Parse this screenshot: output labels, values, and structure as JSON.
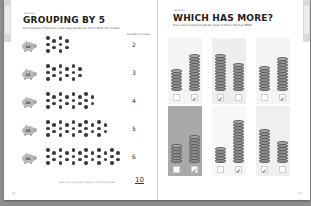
{
  "left_page": {
    "kicker": "Activity",
    "title": "GROUPING BY 5",
    "instruction": "Circle groups of 5 pennies. How many groups are there? Write the number.",
    "column_header": "Number of Groups",
    "rows": [
      {
        "pig_label": "10",
        "dot_count": 10,
        "dot_columns": 4,
        "answer": "2"
      },
      {
        "pig_label": "15",
        "dot_count": 15,
        "dot_columns": 6,
        "answer": "3"
      },
      {
        "pig_label": "20",
        "dot_count": 20,
        "dot_columns": 8,
        "answer": "4"
      },
      {
        "pig_label": "25",
        "dot_count": 25,
        "dot_columns": 10,
        "answer": "5"
      },
      {
        "pig_label": "30",
        "dot_count": 30,
        "dot_columns": 12,
        "answer": "6"
      }
    ],
    "footnote": "How many groups of 5 make 50? Write the number.",
    "total_answer": "10",
    "page_number": "10"
  },
  "right_page": {
    "kicker": "Activity",
    "title": "WHICH HAS MORE?",
    "instruction": "Put a check mark beneath the stack of dimes that has MORE.",
    "panels": [
      {
        "background": "#f4f4f4",
        "stacks": [
          {
            "coins": 7,
            "checked": false
          },
          {
            "coins": 12,
            "checked": true
          }
        ]
      },
      {
        "background": "#eeeeee",
        "stacks": [
          {
            "coins": 12,
            "checked": true
          },
          {
            "coins": 9,
            "checked": false
          }
        ]
      },
      {
        "background": "#f4f4f4",
        "stacks": [
          {
            "coins": 8,
            "checked": false
          },
          {
            "coins": 11,
            "checked": true
          }
        ]
      },
      {
        "background": "#a9a9a9",
        "stacks": [
          {
            "coins": 6,
            "checked": false
          },
          {
            "coins": 9,
            "checked": true
          }
        ]
      },
      {
        "background": "#f7f7f7",
        "stacks": [
          {
            "coins": 5,
            "checked": false
          },
          {
            "coins": 14,
            "checked": true
          }
        ]
      },
      {
        "background": "#efefef",
        "stacks": [
          {
            "coins": 11,
            "checked": true
          },
          {
            "coins": 7,
            "checked": false
          }
        ]
      }
    ],
    "check_mark": "✓",
    "page_number": "11"
  }
}
